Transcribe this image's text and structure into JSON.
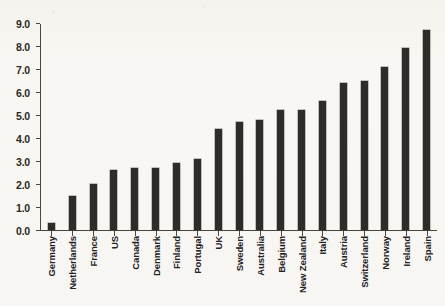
{
  "chart_data": {
    "type": "bar",
    "title": "",
    "subtitle": "",
    "xlabel": "",
    "ylabel": "",
    "ylim": [
      0.0,
      9.0
    ],
    "ytick_step": 1.0,
    "ytick_labels": [
      "9.0",
      "8.0",
      "7.0",
      "6.0",
      "5.0",
      "4.0",
      "3.0",
      "2.0",
      "1.0",
      "0.0"
    ],
    "ytick_values": [
      9.0,
      8.0,
      7.0,
      6.0,
      5.0,
      4.0,
      3.0,
      2.0,
      1.0,
      0.0
    ],
    "grid": false,
    "legend": false,
    "legend_position": "none",
    "orientation": "vertical",
    "bar_color": "#2e2c28",
    "background_color": "#f7f6f2",
    "axis_color": "#4a4741",
    "categories": [
      "Germany",
      "Netherlands",
      "France",
      "US",
      "Canada",
      "Denmark",
      "Finland",
      "Portugal",
      "UK",
      "Sweden",
      "Australia",
      "Belgium",
      "New Zealand",
      "Italy",
      "Austria",
      "Switzerland",
      "Norway",
      "Ireland",
      "Spain"
    ],
    "values": [
      0.3,
      1.5,
      2.0,
      2.6,
      2.7,
      2.7,
      2.9,
      3.1,
      4.4,
      4.7,
      4.8,
      5.2,
      5.2,
      5.6,
      6.4,
      6.5,
      7.1,
      7.9,
      8.7
    ],
    "annotations": []
  }
}
